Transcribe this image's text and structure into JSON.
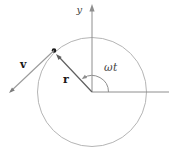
{
  "diagram": {
    "labels": {
      "y_axis": "y",
      "velocity_vector": "v",
      "radius_vector": "r",
      "angle": "ωt"
    },
    "colors": {
      "background": "#ffffff",
      "circle": "#b5b5b5",
      "axes": "#8e8e8e",
      "angle_arc": "#8e8e8e",
      "radius_vector": "#5f5f5f",
      "velocity_vector": "#9b9b9b",
      "velocity_arrowhead": "#7d7d7d",
      "particle_dot": "#1a1a1a",
      "vector_label_text": "#1a1a1a",
      "axis_label_text": "#3f3f3f",
      "angle_label_text": "#3f3f3f"
    }
  }
}
